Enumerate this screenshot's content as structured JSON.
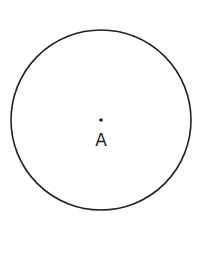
{
  "diagram": {
    "type": "geometry",
    "circle": {
      "cx": 101,
      "cy": 120,
      "r": 90,
      "stroke": "#222222"
    },
    "center_point": {
      "x": 101,
      "y": 120,
      "label": "A"
    }
  }
}
